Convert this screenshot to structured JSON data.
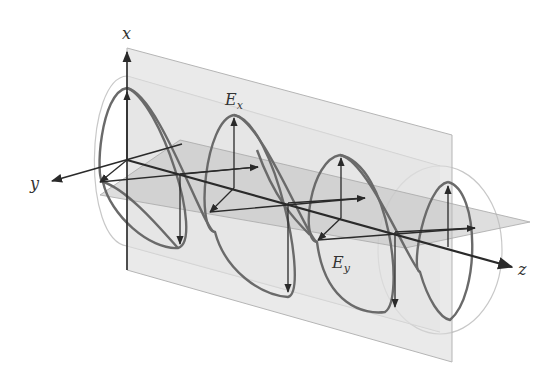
{
  "diagram": {
    "axes": {
      "x": "x",
      "y": "y",
      "z": "z"
    },
    "components": {
      "ex": {
        "base": "E",
        "sub": "x"
      },
      "ey": {
        "base": "E",
        "sub": "y"
      }
    },
    "colors": {
      "axis": "#2a2a2a",
      "helix": "#6a6a6a",
      "vertical_plane": "#d8d8d8",
      "horizontal_plane": "#c4c4c4",
      "cylinder": "#bdbdbd"
    }
  }
}
